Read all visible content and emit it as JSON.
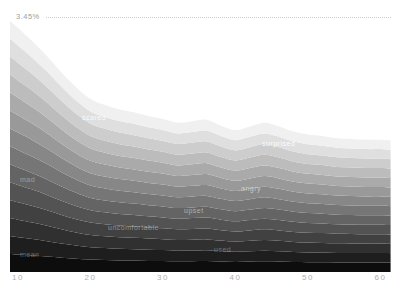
{
  "title": "FEELINGS BY AGE",
  "chart_data": {
    "type": "area",
    "variant": "stacked-streamgraph-grayscale",
    "title": "FEELINGS BY AGE",
    "xlabel": "age",
    "ylabel": "",
    "y_unit": "%",
    "grid": false,
    "legend": "none",
    "x_ticks": [
      "10",
      "20",
      "30",
      "40",
      "50",
      "60"
    ],
    "x_tick_values": [
      10,
      20,
      30,
      40,
      50,
      60
    ],
    "x_range": [
      8.9,
      61.4
    ],
    "y_range": [
      0,
      3.45
    ],
    "y_max_annotation": {
      "text": "3.45%",
      "value": 3.45
    },
    "ages": [
      8.9,
      10,
      12,
      14,
      16,
      18,
      20,
      22,
      24,
      26,
      28,
      30,
      32,
      34,
      36,
      38,
      40,
      42,
      44,
      46,
      48,
      50,
      52,
      54,
      56,
      58,
      60,
      61.4
    ],
    "totals_percent": [
      3.4,
      3.3,
      3.12,
      2.92,
      2.7,
      2.5,
      2.34,
      2.26,
      2.2,
      2.16,
      2.11,
      2.07,
      2.02,
      2.04,
      2.06,
      1.98,
      1.92,
      1.97,
      2.02,
      1.97,
      1.9,
      1.86,
      1.84,
      1.81,
      1.8,
      1.79,
      1.79,
      1.78
    ],
    "band_count": 14,
    "share_per_band": 0.0714,
    "bands_bottom_to_top": [
      {
        "name": "mean",
        "color": "#0d0d0d"
      },
      {
        "name": "used",
        "color": "#1e1e1e"
      },
      {
        "name": "band-3",
        "color": "#303030"
      },
      {
        "name": "uncomfortable",
        "color": "#414141"
      },
      {
        "name": "band-5",
        "color": "#535353"
      },
      {
        "name": "upset",
        "color": "#646464"
      },
      {
        "name": "mad",
        "color": "#767676"
      },
      {
        "name": "angry",
        "color": "#878787"
      },
      {
        "name": "band-9",
        "color": "#999999"
      },
      {
        "name": "band-10",
        "color": "#aaaaaa"
      },
      {
        "name": "surprised",
        "color": "#bcbcbc"
      },
      {
        "name": "scared",
        "color": "#cdcdcd"
      },
      {
        "name": "band-13",
        "color": "#dfdfdf"
      },
      {
        "name": "band-14",
        "color": "#f0f0f0"
      }
    ],
    "band_labels": [
      {
        "text": "scared",
        "x": 82,
        "y": 114,
        "opacity": 0.85
      },
      {
        "text": "surprised",
        "x": 262,
        "y": 140,
        "opacity": 0.9
      },
      {
        "text": "mad",
        "x": 20,
        "y": 176,
        "opacity": 0.35
      },
      {
        "text": "angry",
        "x": 241,
        "y": 185,
        "opacity": 0.5
      },
      {
        "text": "upset",
        "x": 184,
        "y": 207,
        "opacity": 0.45
      },
      {
        "text": "uncomfortable",
        "x": 108,
        "y": 224,
        "opacity": 0.4
      },
      {
        "text": "used",
        "x": 214,
        "y": 246,
        "opacity": 0.3
      },
      {
        "text": "mean",
        "x": 20,
        "y": 251,
        "opacity": 0.3
      }
    ],
    "layout": {
      "x_px_at_age10": 18,
      "px_per_year": 7.25,
      "y_px_at_zero": 272,
      "y_px_at_max": 17
    }
  }
}
